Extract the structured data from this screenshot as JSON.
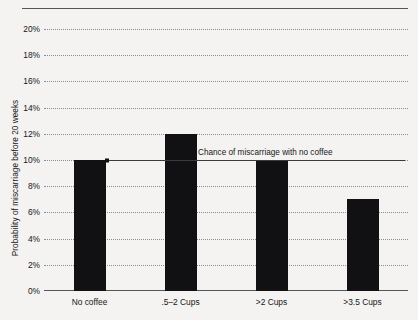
{
  "chart_data": {
    "type": "bar",
    "title": "",
    "xlabel": "",
    "ylabel": "Probability of miscarriage before 20 weeks",
    "categories": [
      "No coffee",
      ".5–2 Cups",
      ">2 Cups",
      ">3.5 Cups"
    ],
    "values": [
      10,
      12,
      10,
      7
    ],
    "ylim": [
      0,
      20
    ],
    "ytick_labels": [
      "0%",
      "2%",
      "4%",
      "6%",
      "8%",
      "10%",
      "12%",
      "14%",
      "16%",
      "18%",
      "20%"
    ],
    "ytick_values": [
      0,
      2,
      4,
      6,
      8,
      10,
      12,
      14,
      16,
      18,
      20
    ],
    "grid": true,
    "legend": "none",
    "bar_color": "#111114",
    "annotations": [
      {
        "label": "Chance of miscarriage with no coffee",
        "value": 10,
        "kind": "reference-line"
      }
    ]
  }
}
